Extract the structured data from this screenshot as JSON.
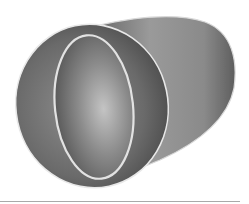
{
  "illustration": {
    "subject": "3d-oval-tube",
    "colors": {
      "background": "#ffffff",
      "tube_dark": "#4a4a4a",
      "tube_mid": "#7a7a7a",
      "tube_light": "#b8b8b8",
      "rim": "#e6e6e6",
      "baseline": "#a9a9a9"
    }
  }
}
